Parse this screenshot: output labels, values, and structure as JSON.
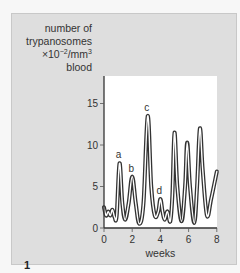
{
  "figure": {
    "number": "1",
    "ylabel_lines": [
      "number of",
      "trypanosomes",
      "×10",
      "/mm",
      "blood"
    ],
    "ylabel_exp1": "−2",
    "ylabel_exp2": "3"
  },
  "chart_data": {
    "type": "line",
    "title": "",
    "xlabel": "weeks",
    "ylabel": "number of trypanosomes ×10^-2/mm^3 blood",
    "xlim": [
      0,
      8
    ],
    "ylim": [
      0,
      18
    ],
    "x_ticks": [
      0,
      2,
      4,
      6,
      8
    ],
    "y_ticks": [
      0,
      5,
      10,
      15
    ],
    "grid": false,
    "legend": null,
    "series": [
      {
        "name": "parasitaemia",
        "x": [
          0,
          0.15,
          0.3,
          0.45,
          0.6,
          0.75,
          0.9,
          1.1,
          1.3,
          1.5,
          1.75,
          2.0,
          2.25,
          2.5,
          2.8,
          3.1,
          3.35,
          3.6,
          3.85,
          4.0,
          4.15,
          4.3,
          4.5,
          4.7,
          4.85,
          5.0,
          5.2,
          5.5,
          5.75,
          5.9,
          6.1,
          6.4,
          6.6,
          6.8,
          7.0,
          7.3,
          7.6,
          8.0
        ],
        "values": [
          2.5,
          1.5,
          2.0,
          1.5,
          2.2,
          1.3,
          1.5,
          7.8,
          3.0,
          1.0,
          3.0,
          6.2,
          3.0,
          0.5,
          3.0,
          13.5,
          5.0,
          1.5,
          2.0,
          3.5,
          2.0,
          1.0,
          2.0,
          0.8,
          4.0,
          11.5,
          5.0,
          0.8,
          5.0,
          10.3,
          5.0,
          0.6,
          5.0,
          12.0,
          7.0,
          1.5,
          3.5,
          6.8
        ]
      }
    ],
    "annotations": [
      {
        "label": "a",
        "x": 1.1,
        "y": 7.8
      },
      {
        "label": "b",
        "x": 2.0,
        "y": 6.2
      },
      {
        "label": "c",
        "x": 3.1,
        "y": 13.5
      },
      {
        "label": "d",
        "x": 4.0,
        "y": 3.5
      }
    ],
    "layout": {
      "plot_left": 92,
      "plot_top": 62,
      "plot_right": 205,
      "plot_bottom": 214,
      "px_per_x": 14.1,
      "px_per_y": 8.3
    }
  }
}
